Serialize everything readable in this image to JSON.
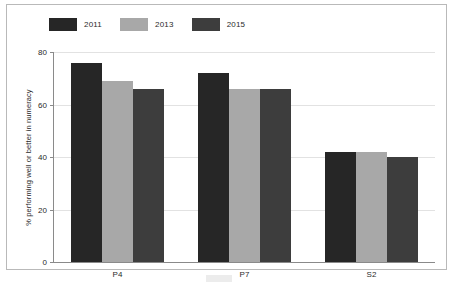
{
  "chart_data": {
    "type": "bar",
    "title": "",
    "subtitle": "",
    "xlabel": "",
    "ylabel": "% performing well or better in numeracy",
    "categories": [
      "P4",
      "P7",
      "S2"
    ],
    "series": [
      {
        "name": "2011",
        "color": "#262626",
        "values": [
          76,
          72,
          42
        ]
      },
      {
        "name": "2013",
        "color": "#a8a8a8",
        "values": [
          69,
          66,
          42
        ]
      },
      {
        "name": "2015",
        "color": "#3d3d3d",
        "values": [
          66,
          66,
          40
        ]
      }
    ],
    "ylim": [
      0,
      80
    ],
    "yticks": [
      0,
      20,
      40,
      60,
      80
    ],
    "ytick_labels": [
      "0",
      "20",
      "40",
      "60",
      "80"
    ],
    "grid": true,
    "grid_axis": "y",
    "legend_position": "top-left",
    "axis_color": "#8a8a8a",
    "grid_color": "#e2e2e2",
    "background": "#ffffff",
    "frame_color": "#b9b9b9"
  }
}
